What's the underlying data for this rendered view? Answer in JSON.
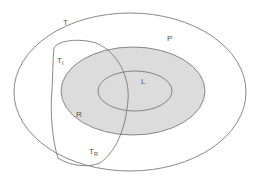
{
  "diagram": {
    "type": "nested-set-diagram",
    "colors": {
      "background": "#ffffff",
      "stroke": "#7a7a7a",
      "shaded_fill": "#dcdcdc"
    },
    "sets": {
      "T": {
        "label": "T",
        "description": "outer ellipse"
      },
      "P": {
        "label": "P",
        "description": "shaded ellipse inside T"
      },
      "L": {
        "label": "L",
        "description": "inner ellipse inside P"
      },
      "TI": {
        "label": "T",
        "subscript": "I",
        "description": "upper-left lens region"
      },
      "TR": {
        "label": "T",
        "subscript": "R",
        "description": "lower lens region"
      },
      "R": {
        "label": "R",
        "description": "region where lens overlaps P"
      }
    }
  }
}
